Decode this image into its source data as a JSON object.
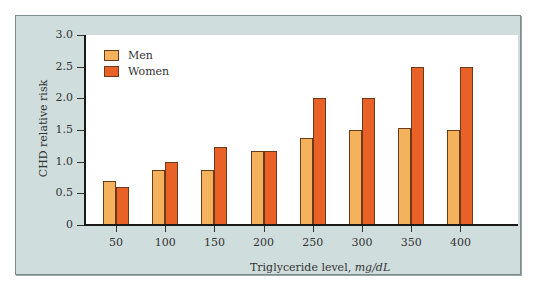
{
  "chart_data": {
    "type": "bar",
    "title": "",
    "xlabel": "Triglyceride level,",
    "xlabel_unit": "mg/dL",
    "ylabel": "CHD relative risk",
    "ylim": [
      0,
      3.0
    ],
    "yticks": [
      "0",
      "0.5",
      "1.0",
      "1.5",
      "2.0",
      "2.5",
      "3.0"
    ],
    "categories": [
      "50",
      "100",
      "150",
      "200",
      "250",
      "300",
      "350",
      "400"
    ],
    "series": [
      {
        "name": "Men",
        "color": "#f4b25c",
        "values": [
          0.7,
          0.87,
          0.87,
          1.17,
          1.38,
          1.5,
          1.53,
          1.5
        ]
      },
      {
        "name": "Women",
        "color": "#ea6128",
        "values": [
          0.6,
          1.0,
          1.23,
          1.17,
          2.0,
          2.0,
          2.5,
          2.5
        ]
      }
    ],
    "legend_position": "top-left inside plot",
    "grid": false
  },
  "legend": {
    "men": "Men",
    "women": "Women"
  },
  "axes": {
    "y_title": "CHD relative risk",
    "x_title": "Triglyceride level,",
    "x_unit": "mg/dL"
  }
}
